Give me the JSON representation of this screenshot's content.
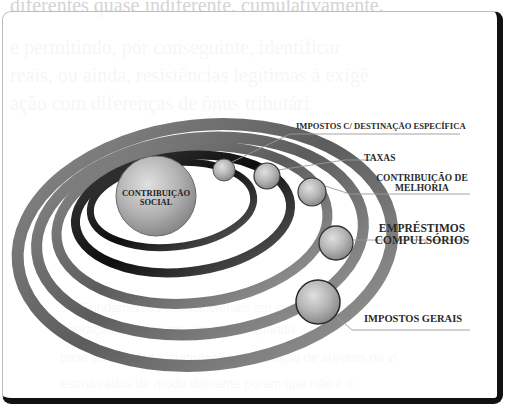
{
  "background_text": {
    "lines": [
      "diferentes quase indiferente, cumulativamente.",
      "e permitindo, por conseguinte, identificar",
      "reais, ou ainda, resistências legítimas à exigê",
      "ação  com  diferenças  de  ônus  tributári"
    ],
    "small_lines": [
      "3.8 Fundamentos constitucionais em sentido estrito",
      "operação dos tributos, em regra, quando",
      "base da atividade, cumulação em relação de sujeitos no vi",
      "estruturados de modo diferente porém que não é o"
    ]
  },
  "diagram": {
    "center": {
      "label_line1": "CONTRIBUIÇÃO",
      "label_line2": "SOCIAL"
    },
    "labels": {
      "impostos_destinacao": "IMPOSTOS C/ DESTINAÇÃO ESPECÍFICA",
      "taxas": "TAXAS",
      "contribuicao_melhoria_1": "CONTRIBUIÇÃO DE",
      "contribuicao_melhoria_2": "MELHORIA",
      "emprestimos_1": "EMPRÉSTIMOS",
      "emprestimos_2": "COMPULSÓRIOS",
      "impostos_gerais": "IMPOSTOS GERAIS"
    },
    "colors": {
      "ring_dark": "#1a1a1a",
      "ring_mid": "#6e6e6e",
      "sphere_fill": "#a8a8a8",
      "label_text": "#2a2a2a",
      "card_border": "#111111"
    }
  }
}
